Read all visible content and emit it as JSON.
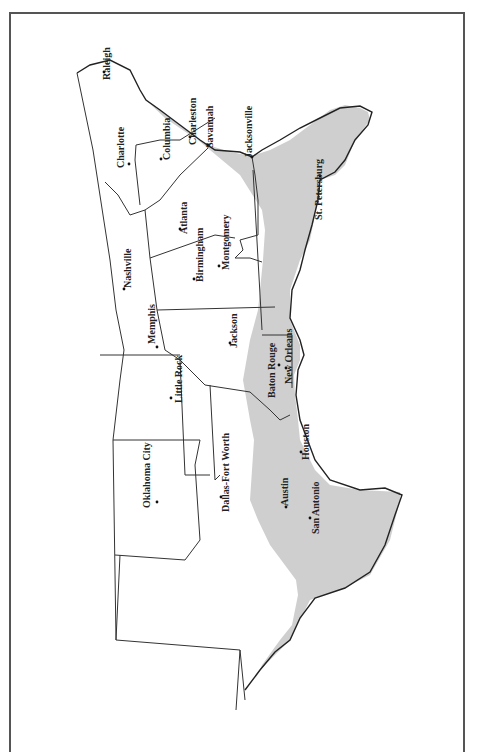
{
  "map": {
    "description": "Southern United States (rotated 90°) with shaded Gulf/Atlantic coastal plain region",
    "shade_color": "#cfcfcf",
    "border_color": "#555555",
    "cities": [
      {
        "name": "Raleigh",
        "x": 104,
        "y": 72,
        "lx": 110,
        "ly": 80
      },
      {
        "name": "Charlotte",
        "x": 129,
        "y": 164,
        "lx": 124,
        "ly": 168
      },
      {
        "name": "Columbia",
        "x": 161,
        "y": 159,
        "lx": 170,
        "ly": 160
      },
      {
        "name": "Charleston",
        "x": 190,
        "y": 137,
        "lx": 196,
        "ly": 145
      },
      {
        "name": "Savannah",
        "x": 208,
        "y": 145,
        "lx": 213,
        "ly": 148
      },
      {
        "name": "Jacksonville",
        "x": 252,
        "y": 157,
        "lx": 252,
        "ly": 158
      },
      {
        "name": "St. Petersburg",
        "x": 320,
        "y": 176,
        "lx": 322,
        "ly": 220
      },
      {
        "name": "Atlanta",
        "x": 180,
        "y": 229,
        "lx": 187,
        "ly": 234
      },
      {
        "name": "Birmingham",
        "x": 194,
        "y": 279,
        "lx": 203,
        "ly": 282
      },
      {
        "name": "Montgomery",
        "x": 219,
        "y": 266,
        "lx": 229,
        "ly": 270
      },
      {
        "name": "Nashville",
        "x": 124,
        "y": 289,
        "lx": 131,
        "ly": 288
      },
      {
        "name": "Memphis",
        "x": 157,
        "y": 347,
        "lx": 155,
        "ly": 344
      },
      {
        "name": "Jackson",
        "x": 230,
        "y": 343,
        "lx": 237,
        "ly": 348
      },
      {
        "name": "Baton Rouge",
        "x": 279,
        "y": 365,
        "lx": 275,
        "ly": 398
      },
      {
        "name": "New Orleans",
        "x": 286,
        "y": 368,
        "lx": 292,
        "ly": 384
      },
      {
        "name": "Little Rock",
        "x": 171,
        "y": 398,
        "lx": 182,
        "ly": 403
      },
      {
        "name": "Oklahoma City",
        "x": 157,
        "y": 502,
        "lx": 150,
        "ly": 508
      },
      {
        "name": "Dallas-Fort Worth",
        "x": 221,
        "y": 497,
        "lx": 229,
        "ly": 512
      },
      {
        "name": "Houston",
        "x": 301,
        "y": 452,
        "lx": 309,
        "ly": 460
      },
      {
        "name": "Austin",
        "x": 286,
        "y": 507,
        "lx": 288,
        "ly": 506
      },
      {
        "name": "San Antonio",
        "x": 310,
        "y": 518,
        "lx": 319,
        "ly": 534
      }
    ]
  }
}
